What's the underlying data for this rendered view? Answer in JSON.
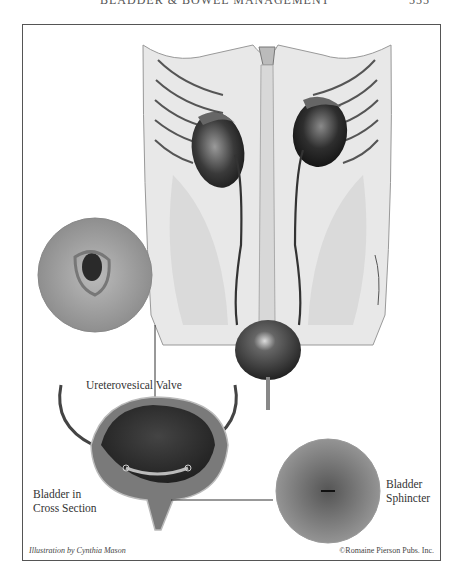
{
  "running_head": {
    "title": "BLADDER & BOWEL MANAGEMENT",
    "page_number": "555"
  },
  "figure": {
    "labels": {
      "ureterovesical_valve": "Ureterovesical Valve",
      "bladder_cross_section_line1": "Bladder in",
      "bladder_cross_section_line2": "Cross Section",
      "bladder_sphincter_line1": "Bladder",
      "bladder_sphincter_line2": "Sphincter"
    },
    "credits": {
      "illustrator": "Illustration by Cynthia Mason",
      "copyright": "©Romaine Pierson Pubs. Inc."
    }
  }
}
